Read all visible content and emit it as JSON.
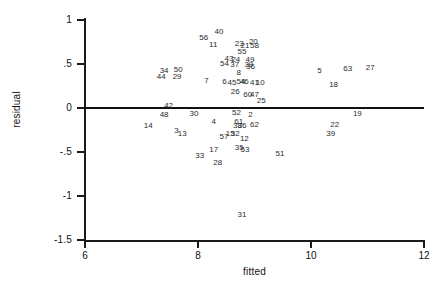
{
  "chart_data": {
    "type": "scatter",
    "title": "",
    "xlabel": "fitted",
    "ylabel": "residual",
    "xlim": [
      6,
      12
    ],
    "ylim": [
      -1.5,
      1.1
    ],
    "xticks": [
      6,
      8,
      10,
      12
    ],
    "xtick_labels": [
      "6",
      "8",
      "10",
      "12"
    ],
    "yticks": [
      1,
      0.5,
      0,
      -0.5,
      -1,
      -1.5
    ],
    "ytick_labels": [
      "1",
      ".5",
      "0",
      "-.5",
      "-1",
      "-1.5"
    ],
    "grid": false,
    "legend": null,
    "marker_style": "observation-number-label",
    "reference_lines": [
      {
        "axis": "y",
        "value": 0,
        "color": "#111111"
      }
    ],
    "points": [
      {
        "label": "40",
        "x": 8.37,
        "y": 0.86
      },
      {
        "label": "56",
        "x": 8.1,
        "y": 0.79
      },
      {
        "label": "11",
        "x": 8.27,
        "y": 0.72
      },
      {
        "label": "23",
        "x": 8.73,
        "y": 0.73
      },
      {
        "label": "21",
        "x": 8.83,
        "y": 0.7
      },
      {
        "label": "20",
        "x": 8.98,
        "y": 0.75
      },
      {
        "label": "58",
        "x": 9.0,
        "y": 0.7
      },
      {
        "label": "55",
        "x": 8.78,
        "y": 0.64
      },
      {
        "label": "43",
        "x": 8.55,
        "y": 0.56
      },
      {
        "label": "24",
        "x": 8.67,
        "y": 0.55
      },
      {
        "label": "49",
        "x": 8.92,
        "y": 0.55
      },
      {
        "label": "54",
        "x": 8.47,
        "y": 0.5
      },
      {
        "label": "37",
        "x": 8.65,
        "y": 0.49
      },
      {
        "label": "39",
        "x": 8.9,
        "y": 0.49
      },
      {
        "label": "36",
        "x": 8.93,
        "y": 0.47
      },
      {
        "label": "34",
        "x": 7.4,
        "y": 0.42
      },
      {
        "label": "50",
        "x": 7.65,
        "y": 0.43
      },
      {
        "label": "5",
        "x": 10.15,
        "y": 0.42
      },
      {
        "label": "63",
        "x": 10.65,
        "y": 0.44
      },
      {
        "label": "27",
        "x": 11.05,
        "y": 0.46
      },
      {
        "label": "44",
        "x": 7.35,
        "y": 0.35
      },
      {
        "label": "29",
        "x": 7.63,
        "y": 0.35
      },
      {
        "label": "8",
        "x": 8.72,
        "y": 0.4
      },
      {
        "label": "7",
        "x": 8.15,
        "y": 0.31
      },
      {
        "label": "6",
        "x": 8.47,
        "y": 0.29
      },
      {
        "label": "45",
        "x": 8.6,
        "y": 0.28
      },
      {
        "label": "54",
        "x": 8.76,
        "y": 0.29
      },
      {
        "label": "46",
        "x": 8.82,
        "y": 0.3
      },
      {
        "label": "41",
        "x": 9.0,
        "y": 0.28
      },
      {
        "label": "10",
        "x": 9.1,
        "y": 0.28
      },
      {
        "label": "18",
        "x": 10.4,
        "y": 0.26
      },
      {
        "label": "26",
        "x": 8.66,
        "y": 0.18
      },
      {
        "label": "60",
        "x": 8.88,
        "y": 0.15
      },
      {
        "label": "47",
        "x": 9.0,
        "y": 0.15
      },
      {
        "label": "25",
        "x": 9.12,
        "y": 0.08
      },
      {
        "label": "42",
        "x": 7.48,
        "y": 0.02
      },
      {
        "label": "52",
        "x": 8.68,
        "y": -0.06
      },
      {
        "label": "2",
        "x": 8.93,
        "y": -0.08
      },
      {
        "label": "48",
        "x": 7.4,
        "y": -0.08
      },
      {
        "label": "30",
        "x": 7.93,
        "y": -0.07
      },
      {
        "label": "19",
        "x": 10.82,
        "y": -0.07
      },
      {
        "label": "61",
        "x": 8.72,
        "y": -0.16
      },
      {
        "label": "4",
        "x": 8.28,
        "y": -0.16
      },
      {
        "label": "38",
        "x": 8.7,
        "y": -0.21
      },
      {
        "label": "36",
        "x": 8.78,
        "y": -0.21
      },
      {
        "label": "62",
        "x": 9.0,
        "y": -0.19
      },
      {
        "label": "22",
        "x": 10.42,
        "y": -0.19
      },
      {
        "label": "14",
        "x": 7.12,
        "y": -0.21
      },
      {
        "label": "3",
        "x": 7.62,
        "y": -0.26
      },
      {
        "label": "13",
        "x": 7.72,
        "y": -0.3
      },
      {
        "label": "15",
        "x": 8.57,
        "y": -0.29
      },
      {
        "label": "32",
        "x": 8.66,
        "y": -0.3
      },
      {
        "label": "57",
        "x": 8.46,
        "y": -0.33
      },
      {
        "label": "12",
        "x": 8.82,
        "y": -0.35
      },
      {
        "label": "39",
        "x": 10.35,
        "y": -0.29
      },
      {
        "label": "35",
        "x": 8.73,
        "y": -0.45
      },
      {
        "label": "53",
        "x": 8.83,
        "y": -0.48
      },
      {
        "label": "17",
        "x": 8.28,
        "y": -0.48
      },
      {
        "label": "51",
        "x": 9.45,
        "y": -0.52
      },
      {
        "label": "33",
        "x": 8.03,
        "y": -0.55
      },
      {
        "label": "28",
        "x": 8.35,
        "y": -0.62
      },
      {
        "label": "31",
        "x": 8.78,
        "y": -1.22
      }
    ]
  }
}
